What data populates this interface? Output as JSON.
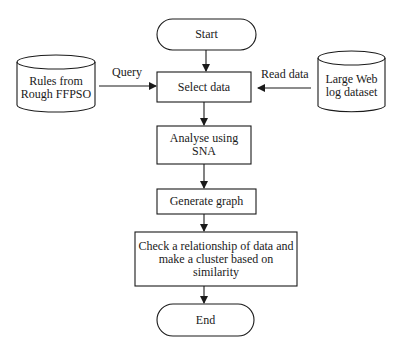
{
  "diagram": {
    "type": "flowchart",
    "nodes": {
      "start": "Start",
      "select": "Select data",
      "analyse_l1": "Analyse using",
      "analyse_l2": "SNA",
      "generate": "Generate graph",
      "check_l1": "Check a relationship of data and",
      "check_l2": "make a cluster based on",
      "check_l3": "similarity",
      "end": "End",
      "rules_l1": "Rules from",
      "rules_l2": "Rough FFPSO",
      "weblog_l1": "Large Web",
      "weblog_l2": "log dataset"
    },
    "edges": {
      "query": "Query",
      "read": "Read data"
    },
    "colors": {
      "stroke": "#1a1a1a",
      "background": "#ffffff"
    }
  }
}
